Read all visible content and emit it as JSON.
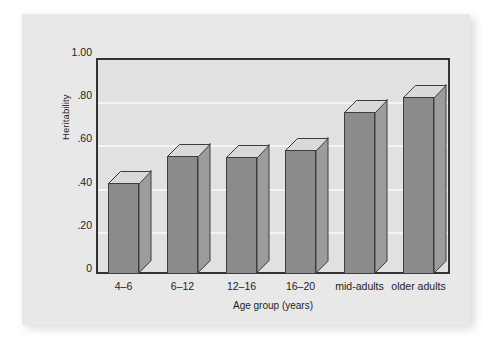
{
  "chart_data": {
    "type": "bar",
    "title": "",
    "subtitle": "",
    "xlabel": "Age group (years)",
    "ylabel": "Heritability",
    "categories": [
      "4–6",
      "6–12",
      "12–16",
      "16–20",
      "mid-adults",
      "older adults"
    ],
    "values": [
      0.42,
      0.545,
      0.54,
      0.575,
      0.75,
      0.82
    ],
    "series": [
      {
        "name": "Heritability",
        "values": [
          0.42,
          0.545,
          0.54,
          0.575,
          0.75,
          0.82
        ]
      }
    ],
    "ylim": [
      0,
      1.0
    ],
    "ytick_values": [
      1.0,
      0.8,
      0.6,
      0.4,
      0.2,
      0
    ],
    "ytick_labels": [
      "1.00",
      ".80",
      ".60",
      ".40",
      ".20",
      "0"
    ],
    "grid": true,
    "grid_axis": "y",
    "legend": false,
    "legend_position": "none",
    "bar_style": "3d-block",
    "annotations": []
  },
  "colors": {
    "page_background": "#ffffff",
    "panel_background": "#e8e8e8",
    "plot_background": "#e1e1e1",
    "plot_border": "#333333",
    "gridline": "#f4f4f4",
    "bar_front": "#8b8b8b",
    "bar_side": "#9c9c9c",
    "bar_top": "#d9d9d9",
    "bar_outline": "#3d3d3d",
    "text": "#1c1c1c"
  }
}
